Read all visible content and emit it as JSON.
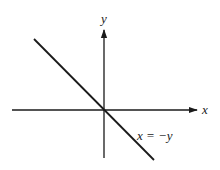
{
  "diagram": {
    "axes": {
      "x_label": "x",
      "y_label": "y",
      "color": "#1a1a1a"
    },
    "line": {
      "equation_label": "x = −y",
      "slope": -1,
      "color": "#1a1a1a"
    }
  }
}
